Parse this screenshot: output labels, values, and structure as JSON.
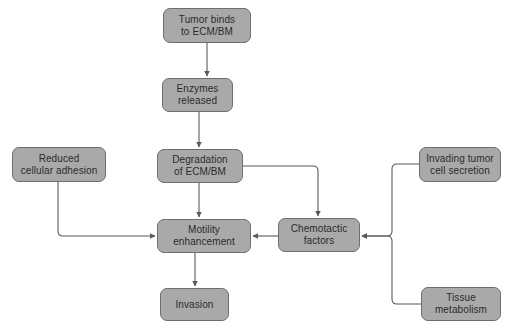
{
  "diagram": {
    "type": "flowchart",
    "background_color": "#ffffff",
    "node_fill_color": "#a9a9a9",
    "node_border_color": "#6e6e6e",
    "node_text_color": "#2b2b2b",
    "edge_color": "#5a5a5a",
    "nodes": [
      {
        "id": "tumor_binds",
        "label": "Tumor binds\nto ECM/BM",
        "x": 163,
        "y": 8,
        "w": 88,
        "h": 35
      },
      {
        "id": "enzymes",
        "label": "Enzymes\nreleased",
        "x": 162,
        "y": 78,
        "w": 71,
        "h": 34
      },
      {
        "id": "degradation",
        "label": "Degradation\nof ECM/BM",
        "x": 157,
        "y": 149,
        "w": 86,
        "h": 34
      },
      {
        "id": "reduced_adhesion",
        "label": "Reduced\ncellular adhesion",
        "x": 12,
        "y": 147,
        "w": 94,
        "h": 35
      },
      {
        "id": "invading_tumor",
        "label": "Invading tumor\ncell secretion",
        "x": 419,
        "y": 147,
        "w": 82,
        "h": 35
      },
      {
        "id": "motility",
        "label": "Motility\nenhancement",
        "x": 157,
        "y": 219,
        "w": 94,
        "h": 34
      },
      {
        "id": "chemotactic",
        "label": "Chemotactic\nfactors",
        "x": 278,
        "y": 218,
        "w": 82,
        "h": 34
      },
      {
        "id": "tissue_metab",
        "label": "Tissue\nmetabolism",
        "x": 421,
        "y": 287,
        "w": 80,
        "h": 34
      },
      {
        "id": "invasion",
        "label": "Invasion",
        "x": 160,
        "y": 288,
        "w": 69,
        "h": 33
      }
    ],
    "edges": [
      {
        "id": "e1",
        "from": "tumor_binds",
        "to": "enzymes",
        "kind": "straight-down"
      },
      {
        "id": "e2",
        "from": "enzymes",
        "to": "degradation",
        "kind": "straight-down"
      },
      {
        "id": "e3",
        "from": "degradation",
        "to": "motility",
        "kind": "straight-down"
      },
      {
        "id": "e4",
        "from": "degradation",
        "to": "chemotactic",
        "kind": "elbow-right-down"
      },
      {
        "id": "e5",
        "from": "reduced_adhesion",
        "to": "motility",
        "kind": "elbow-down-right"
      },
      {
        "id": "e6",
        "from": "chemotactic",
        "to": "motility",
        "kind": "straight-left"
      },
      {
        "id": "e7",
        "from": "invading_tumor",
        "to": "chemotactic",
        "kind": "elbow-left-down-left"
      },
      {
        "id": "e8",
        "from": "tissue_metab",
        "to": "chemotactic",
        "kind": "elbow-left-up-left"
      },
      {
        "id": "e9",
        "from": "motility",
        "to": "invasion",
        "kind": "straight-down"
      }
    ]
  }
}
